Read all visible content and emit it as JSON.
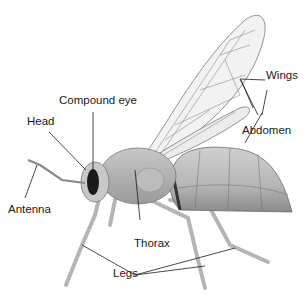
{
  "diagram": {
    "labels": {
      "compound_eye": "Compound eye",
      "head": "Head",
      "antenna": "Antenna",
      "wings": "Wings",
      "abdomen": "Abdomen",
      "thorax": "Thorax",
      "legs": "Legs"
    },
    "colors": {
      "line": "#1a1a1a",
      "body_light": "#d9d9d9",
      "body_mid": "#a8a8a8",
      "body_dark": "#5a5a5a",
      "wing_fill": "#f0f0f0",
      "wing_vein": "#8a8a8a"
    }
  }
}
